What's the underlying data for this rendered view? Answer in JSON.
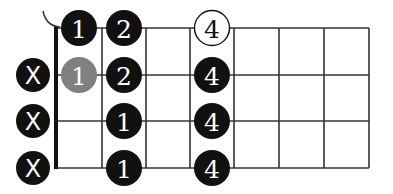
{
  "diagram": {
    "type": "guitar-chord-fretboard",
    "strings_shown": 4,
    "frets_shown": 7,
    "colors": {
      "line": "#333333",
      "dot_filled": "#111111",
      "dot_muted_gray": "#808080",
      "dot_open_fill": "#ffffff",
      "label_on_dark": "#ffffff",
      "label_on_light": "#111111"
    },
    "muted_markers": [
      {
        "row": 1,
        "label": "X"
      },
      {
        "row": 2,
        "label": "X"
      },
      {
        "row": 3,
        "label": "X"
      }
    ],
    "dots": [
      {
        "row": 0,
        "fret": 1,
        "label": "1",
        "style": "filled"
      },
      {
        "row": 0,
        "fret": 2,
        "label": "2",
        "style": "filled"
      },
      {
        "row": 0,
        "fret": 4,
        "label": "4",
        "style": "outline"
      },
      {
        "row": 1,
        "fret": 1,
        "label": "1",
        "style": "gray"
      },
      {
        "row": 1,
        "fret": 2,
        "label": "2",
        "style": "filled"
      },
      {
        "row": 1,
        "fret": 4,
        "label": "4",
        "style": "filled"
      },
      {
        "row": 2,
        "fret": 2,
        "label": "1",
        "style": "filled"
      },
      {
        "row": 2,
        "fret": 4,
        "label": "4",
        "style": "filled"
      },
      {
        "row": 3,
        "fret": 2,
        "label": "1",
        "style": "filled"
      },
      {
        "row": 3,
        "fret": 4,
        "label": "4",
        "style": "filled"
      }
    ],
    "barre_arc": true
  }
}
